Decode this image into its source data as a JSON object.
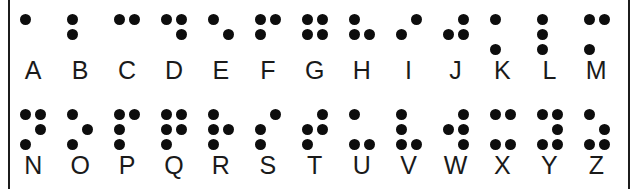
{
  "figure": {
    "name": "Braille alphabet chart",
    "background": "#ffffff",
    "frame_color": "#1c1c1c",
    "dot_color": "#0d0d0d",
    "letter_color": "#1a1a1a"
  },
  "rows": [
    {
      "cells": [
        {
          "letter": "A",
          "dots": [
            1
          ]
        },
        {
          "letter": "B",
          "dots": [
            1,
            2
          ]
        },
        {
          "letter": "C",
          "dots": [
            1,
            4
          ]
        },
        {
          "letter": "D",
          "dots": [
            1,
            4,
            5
          ]
        },
        {
          "letter": "E",
          "dots": [
            1,
            5
          ]
        },
        {
          "letter": "F",
          "dots": [
            1,
            2,
            4
          ]
        },
        {
          "letter": "G",
          "dots": [
            1,
            2,
            4,
            5
          ]
        },
        {
          "letter": "H",
          "dots": [
            1,
            2,
            5
          ]
        },
        {
          "letter": "I",
          "dots": [
            2,
            4
          ]
        },
        {
          "letter": "J",
          "dots": [
            2,
            4,
            5
          ]
        },
        {
          "letter": "K",
          "dots": [
            1,
            3
          ]
        },
        {
          "letter": "L",
          "dots": [
            1,
            2,
            3
          ]
        },
        {
          "letter": "M",
          "dots": [
            1,
            3,
            4
          ]
        }
      ]
    },
    {
      "cells": [
        {
          "letter": "N",
          "dots": [
            1,
            3,
            4,
            5
          ]
        },
        {
          "letter": "O",
          "dots": [
            1,
            3,
            5
          ]
        },
        {
          "letter": "P",
          "dots": [
            1,
            2,
            3,
            4
          ]
        },
        {
          "letter": "Q",
          "dots": [
            1,
            2,
            3,
            4,
            5
          ]
        },
        {
          "letter": "R",
          "dots": [
            1,
            2,
            3,
            5
          ]
        },
        {
          "letter": "S",
          "dots": [
            2,
            3,
            4
          ]
        },
        {
          "letter": "T",
          "dots": [
            2,
            3,
            4,
            5
          ]
        },
        {
          "letter": "U",
          "dots": [
            1,
            3,
            6
          ]
        },
        {
          "letter": "V",
          "dots": [
            1,
            2,
            3,
            6
          ]
        },
        {
          "letter": "W",
          "dots": [
            2,
            4,
            5,
            6
          ]
        },
        {
          "letter": "X",
          "dots": [
            1,
            3,
            4,
            6
          ]
        },
        {
          "letter": "Y",
          "dots": [
            1,
            3,
            4,
            5,
            6
          ]
        },
        {
          "letter": "Z",
          "dots": [
            1,
            3,
            5,
            6
          ]
        }
      ]
    }
  ]
}
